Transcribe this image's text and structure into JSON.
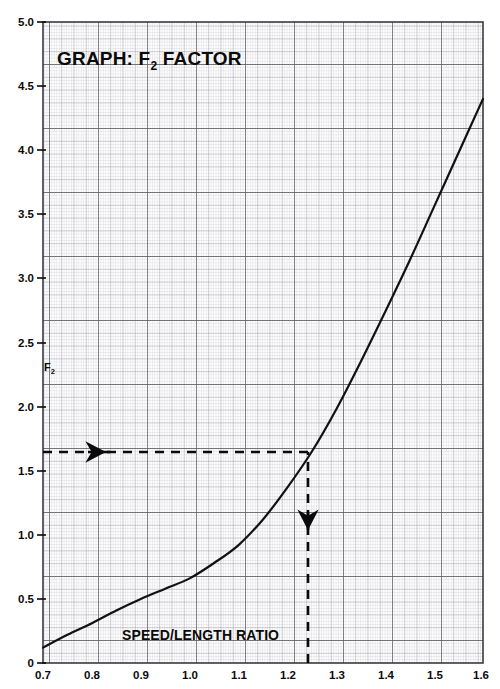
{
  "chart_data": {
    "type": "line",
    "title": "GRAPH: F2 FACTOR",
    "title_main": "GRAPH: F",
    "title_sub": "2",
    "title_tail": " FACTOR",
    "xlabel": "SPEED/LENGTH RATIO",
    "ylabel": "F2",
    "ylabel_main": "F",
    "ylabel_sub": "2",
    "xlim": [
      0.7,
      1.6
    ],
    "ylim": [
      0,
      5.0
    ],
    "grid": true,
    "grid_style": "engineering graph paper, fine minor grid with bold decade lines",
    "legend": "none",
    "xticks": [
      "0.7",
      "0.8",
      "0.9",
      "1.0",
      "1.1",
      "1.2",
      "1.3",
      "1.4",
      "1.5",
      "1.6"
    ],
    "yticks": [
      "0",
      "0.5",
      "1.0",
      "1.5",
      "2.0",
      "2.5",
      "3.0",
      "3.5",
      "4.0",
      "4.5",
      "5.0"
    ],
    "series": [
      {
        "name": "F2 factor curve",
        "x": [
          0.7,
          0.75,
          0.8,
          0.85,
          0.9,
          0.95,
          1.0,
          1.05,
          1.1,
          1.15,
          1.2,
          1.25,
          1.3,
          1.35,
          1.4,
          1.45,
          1.5,
          1.55,
          1.6
        ],
        "y": [
          0.12,
          0.22,
          0.31,
          0.41,
          0.5,
          0.58,
          0.66,
          0.78,
          0.92,
          1.12,
          1.37,
          1.65,
          1.98,
          2.35,
          2.74,
          3.14,
          3.56,
          3.98,
          4.4
        ]
      }
    ],
    "annotations": [
      {
        "name": "vertical-construction-line",
        "style": "dashed",
        "x": 1.25,
        "y_from": 0,
        "y_to": 1.65,
        "arrow": "up",
        "arrow_at_y": 1.12
      },
      {
        "name": "horizontal-construction-line",
        "style": "dashed",
        "y": 1.65,
        "x_from": 1.25,
        "x_to": 0.7,
        "arrow": "left",
        "arrow_at_x": 0.78
      }
    ],
    "read_off": {
      "input_speed_length_ratio": "1.25",
      "output_f2_factor": "1.65"
    },
    "colors": {
      "ink": "#0a0a0a",
      "grid_minor": "#c9c9cf",
      "grid_major": "#8d8d96",
      "grid_bold": "#5b5b63",
      "paper": "#fdfdfd"
    }
  }
}
